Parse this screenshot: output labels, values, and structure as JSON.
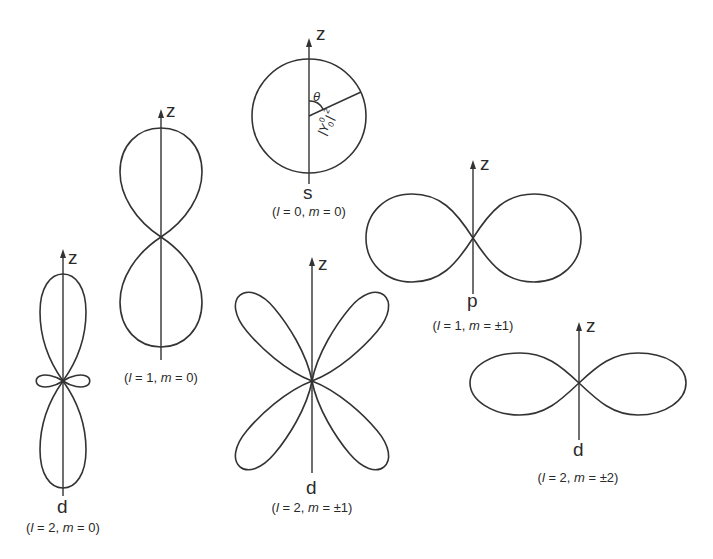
{
  "diagram": {
    "axis_label": "z",
    "orbitals": [
      {
        "id": "s",
        "letter": "s",
        "quantum_numbers": {
          "l_sym": "l",
          "l_val": "0",
          "m_sym": "m",
          "m_val": "0"
        },
        "caption": "(l = 0, m = 0)",
        "annotations": {
          "angle": "θ",
          "radius": "|Y",
          "radius_sup": "0",
          "radius_sub": "0",
          "radius_tail": "|",
          "radius_pow": "2"
        }
      },
      {
        "id": "p-m0",
        "letter": "",
        "caption": "(l = 1, m = 0)",
        "quantum_numbers": {
          "l_sym": "l",
          "l_val": "1",
          "m_sym": "m",
          "m_val": "0"
        }
      },
      {
        "id": "p-m1",
        "letter": "p",
        "caption": "(l = 1, m = ±1)",
        "quantum_numbers": {
          "l_sym": "l",
          "l_val": "1",
          "m_sym": "m",
          "m_val": "±1"
        }
      },
      {
        "id": "d-m0",
        "letter": "d",
        "caption": "(l = 2, m = 0)",
        "quantum_numbers": {
          "l_sym": "l",
          "l_val": "2",
          "m_sym": "m",
          "m_val": "0"
        }
      },
      {
        "id": "d-m1",
        "letter": "d",
        "caption": "(l = 2, m = ±1)",
        "quantum_numbers": {
          "l_sym": "l",
          "l_val": "2",
          "m_sym": "m",
          "m_val": "±1"
        }
      },
      {
        "id": "d-m2",
        "letter": "d",
        "caption": "(l = 2, m = ±2)",
        "quantum_numbers": {
          "l_sym": "l",
          "l_val": "2",
          "m_sym": "m",
          "m_val": "±2"
        }
      }
    ],
    "colors": {
      "line": "#333333",
      "background": "#ffffff"
    }
  }
}
